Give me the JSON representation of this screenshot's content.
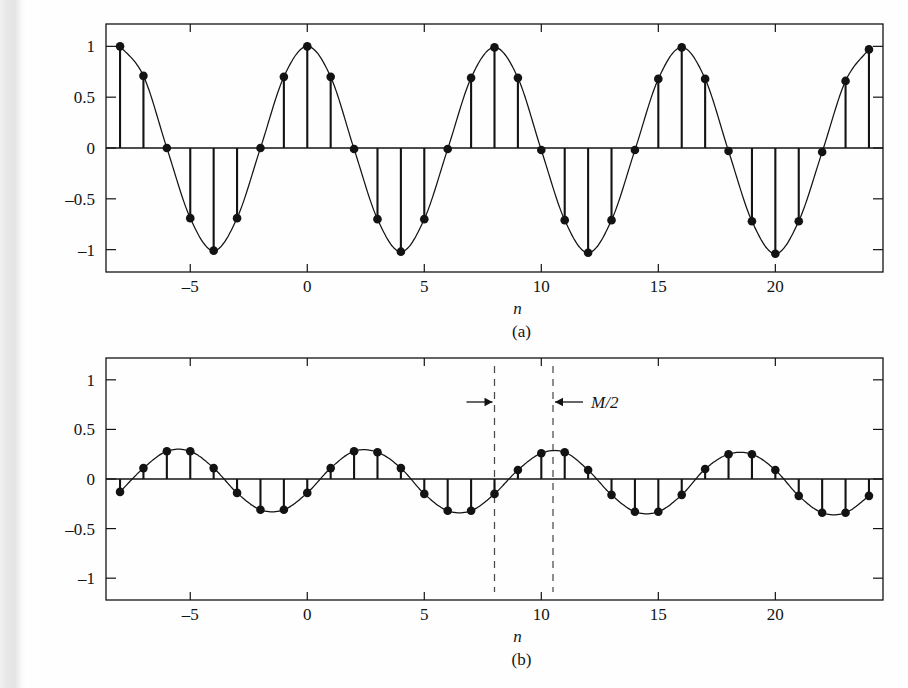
{
  "figure": {
    "title_visible": false,
    "background_color": "#fefefe",
    "ink_color": "#131313",
    "left_scan_strip_color": "#e6e6e6"
  },
  "panels": [
    {
      "id": "panel-a",
      "caption": "(a)",
      "xlabel": "n",
      "ylabel": "",
      "xticklabels": [
        "-5",
        "0",
        "5",
        "10",
        "15",
        "20"
      ],
      "xtickvalues": [
        -5,
        0,
        5,
        10,
        15,
        20
      ],
      "yticklabels": [
        "1",
        "0.5",
        "0",
        "-0.5",
        "-1"
      ],
      "ytickvalues": [
        1,
        0.5,
        0,
        -0.5,
        -1
      ],
      "annotations": []
    },
    {
      "id": "panel-b",
      "caption": "(b)",
      "xlabel": "n",
      "ylabel": "",
      "xticklabels": [
        "-5",
        "0",
        "5",
        "10",
        "15",
        "20"
      ],
      "xtickvalues": [
        -5,
        0,
        5,
        10,
        15,
        20
      ],
      "yticklabels": [
        "1",
        "0.5",
        "0",
        "-0.5",
        "-1"
      ],
      "ytickvalues": [
        1,
        0.5,
        0,
        -0.5,
        -1
      ],
      "annotations": [
        {
          "name": "m-over-2-annotation",
          "text": "M/2",
          "left_marker_n": 8,
          "right_marker_n": 10.5,
          "arrow_left": "→",
          "arrow_right": "←"
        }
      ]
    }
  ],
  "chart_data": [
    {
      "type": "scatter",
      "subtype": "stem",
      "panel": "(a)",
      "title": "",
      "xlabel": "n",
      "ylabel": "",
      "xlim": [
        -8.6,
        24.6
      ],
      "ylim": [
        -1.22,
        1.22
      ],
      "grid": false,
      "legend": null,
      "xticks": [
        -5,
        0,
        5,
        10,
        15,
        20
      ],
      "yticks": [
        1,
        0.5,
        0,
        -0.5,
        -1
      ],
      "description": "Sampled cosine cos(2*pi*n/8), continuous envelope drawn through samples",
      "x": [
        -8,
        -7,
        -6,
        -5,
        -4,
        -3,
        -2,
        -1,
        0,
        1,
        2,
        3,
        4,
        5,
        6,
        7,
        8,
        9,
        10,
        11,
        12,
        13,
        14,
        15,
        16,
        17,
        18,
        19,
        20,
        21,
        22,
        23,
        24
      ],
      "values": [
        1.0,
        0.71,
        0.0,
        -0.69,
        -1.01,
        -0.69,
        0.0,
        0.7,
        1.0,
        0.7,
        -0.01,
        -0.7,
        -1.02,
        -0.7,
        -0.01,
        0.69,
        0.99,
        0.69,
        -0.02,
        -0.71,
        -1.03,
        -0.71,
        -0.02,
        0.68,
        0.99,
        0.68,
        -0.03,
        -0.72,
        -1.04,
        -0.72,
        -0.04,
        0.66,
        0.97
      ]
    },
    {
      "type": "scatter",
      "subtype": "stem",
      "panel": "(b)",
      "title": "",
      "xlabel": "n",
      "ylabel": "",
      "xlim": [
        -8.6,
        24.6
      ],
      "ylim": [
        -1.22,
        1.22
      ],
      "grid": false,
      "legend": null,
      "xticks": [
        -5,
        0,
        5,
        10,
        15,
        20
      ],
      "yticks": [
        1,
        0.5,
        0,
        -0.5,
        -1
      ],
      "description": "Low-amplitude sampled cosine, peak magnitude about 0.3, period 8, phase shifted so peaks fall between samples",
      "x": [
        -8,
        -7,
        -6,
        -5,
        -4,
        -3,
        -2,
        -1,
        0,
        1,
        2,
        3,
        4,
        5,
        6,
        7,
        8,
        9,
        10,
        11,
        12,
        13,
        14,
        15,
        16,
        17,
        18,
        19,
        20,
        21,
        22,
        23,
        24
      ],
      "values": [
        -0.13,
        0.11,
        0.28,
        0.28,
        0.11,
        -0.14,
        -0.31,
        -0.31,
        -0.14,
        0.11,
        0.28,
        0.27,
        0.11,
        -0.15,
        -0.32,
        -0.32,
        -0.15,
        0.09,
        0.26,
        0.27,
        0.09,
        -0.16,
        -0.33,
        -0.33,
        -0.16,
        0.1,
        0.25,
        0.25,
        0.09,
        -0.17,
        -0.34,
        -0.34,
        -0.17
      ]
    }
  ]
}
